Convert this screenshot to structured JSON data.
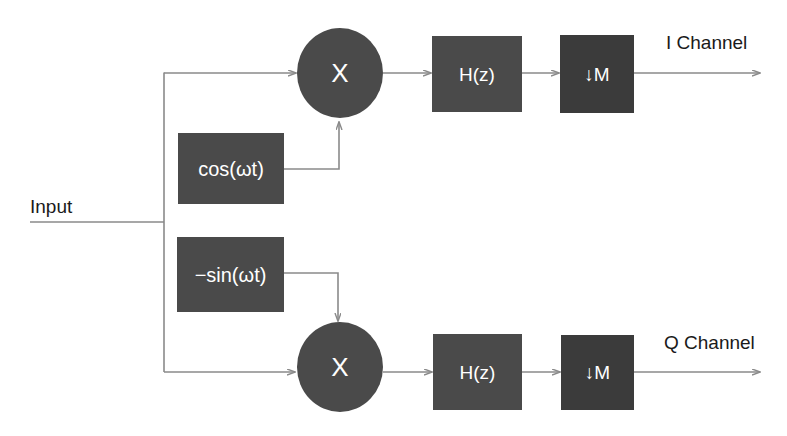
{
  "diagram": {
    "type": "signal-processing-block-diagram",
    "colors": {
      "background": "#ffffff",
      "block_fill": "#4a4a4a",
      "decimator_fill": "#3b3b3b",
      "block_text": "#ffffff",
      "label_text": "#1a1a1a",
      "wire": "#8a8a8a"
    },
    "labels": {
      "input": "Input",
      "i_channel": "I Channel",
      "q_channel": "Q Channel"
    },
    "blocks": {
      "mixer_i": "X",
      "mixer_q": "X",
      "oscillator_cos": "cos(ωt)",
      "oscillator_sin": "−sin(ωt)",
      "filter_i": "H(z)",
      "filter_q": "H(z)",
      "decimator_i": "↓M",
      "decimator_q": "↓M"
    }
  }
}
